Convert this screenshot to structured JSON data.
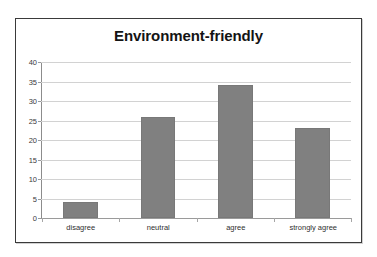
{
  "chart_data": {
    "type": "bar",
    "title": "Environment-friendly",
    "xlabel": "",
    "ylabel": "",
    "categories": [
      "disagree",
      "neutral",
      "agree",
      "strongly agree"
    ],
    "values": [
      4,
      26,
      34,
      23
    ],
    "series": [
      {
        "name": "responses",
        "values": [
          4,
          26,
          34,
          23
        ]
      }
    ],
    "ylim": [
      0,
      40
    ],
    "ytick_step": 5,
    "yticks": [
      "40",
      "35",
      "30",
      "25",
      "20",
      "15",
      "10",
      "5",
      "0"
    ],
    "ytick_values": [
      40,
      35,
      30,
      25,
      20,
      15,
      10,
      5,
      0
    ],
    "grid": true,
    "gridline_axis": "y",
    "legend": false,
    "legend_position": "none",
    "bar_color": "#808080",
    "gridline_color": "#d2d2d2",
    "axis_color": "#8c8c8c",
    "title_color": "#141414",
    "plot_background": "#ffffff",
    "frame_border_color": "#3a3a3a"
  }
}
